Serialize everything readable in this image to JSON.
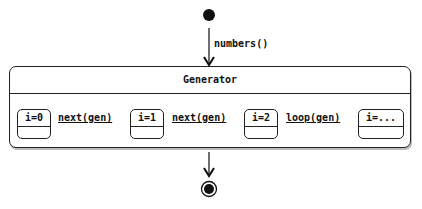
{
  "diagram": {
    "type": "UML state machine",
    "entry_transition": {
      "label": "numbers()"
    },
    "composite_state": {
      "title": "Generator",
      "states": [
        {
          "id": "s0",
          "label": "i=0"
        },
        {
          "id": "s1",
          "label": "i=1"
        },
        {
          "id": "s2",
          "label": "i=2"
        },
        {
          "id": "s3",
          "label": "i=..."
        }
      ],
      "transitions": [
        {
          "from": "s0",
          "to": "s1",
          "label": "next(gen)"
        },
        {
          "from": "s1",
          "to": "s2",
          "label": "next(gen)"
        },
        {
          "from": "s2",
          "to": "s3",
          "label": "loop(gen)"
        }
      ]
    },
    "initial_node": "start",
    "final_node": "end",
    "colors": {
      "stroke": "#222222",
      "fill": "#ffffff",
      "shadow": "#bdbdbd"
    }
  }
}
